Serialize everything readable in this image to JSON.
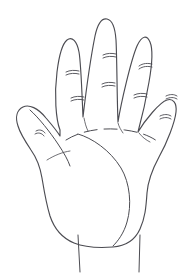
{
  "canvas": {
    "width": 196,
    "height": 275,
    "background_color": "#ffffff",
    "stroke_color": "#4c4c52",
    "title": "open hand line drawing"
  },
  "drawing": {
    "subject": "hand",
    "view": "palm",
    "style": "black outline sketch",
    "fill_color": "#ffffff",
    "stroke_width": 1.15
  },
  "fingers": [
    {
      "name": "thumb",
      "label": "thumb",
      "tip_x": 29,
      "tip_y": 110,
      "crease_count": 1
    },
    {
      "name": "index-finger",
      "label": "index finger",
      "tip_x": 71,
      "tip_y": 41,
      "crease_count": 2
    },
    {
      "name": "middle-finger",
      "label": "middle finger",
      "tip_x": 107,
      "tip_y": 21,
      "crease_count": 2
    },
    {
      "name": "ring-finger",
      "label": "ring finger",
      "tip_x": 146,
      "tip_y": 41,
      "crease_count": 2
    },
    {
      "name": "pinky-finger",
      "label": "little finger",
      "tip_x": 175,
      "tip_y": 106,
      "crease_count": 2
    }
  ],
  "palm": {
    "thenar_crease": "large curved line from index base to wrist",
    "base_arc": "dashed arc across finger bases",
    "web_crease": "short line at thumb web"
  },
  "wrist": {
    "line_count": 2,
    "label": "wrist"
  }
}
